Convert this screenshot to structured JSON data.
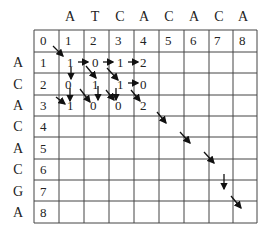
{
  "diagram": {
    "title": "",
    "top_sequence": [
      "A",
      "T",
      "C",
      "A",
      "C",
      "A",
      "C",
      "A"
    ],
    "left_sequence": [
      "A",
      "C",
      "A",
      "C",
      "A",
      "C",
      "G",
      "A"
    ],
    "header_row": [
      "0",
      "1",
      "2",
      "3",
      "4",
      "5",
      "6",
      "7",
      "8"
    ],
    "row_index": [
      "1",
      "2",
      "3",
      "4",
      "5",
      "6",
      "7",
      "8"
    ],
    "cells": [
      [
        "1",
        "0",
        "1",
        "2"
      ],
      [
        "0",
        "1",
        "1",
        "0"
      ],
      [
        "1",
        "0",
        "0",
        "2"
      ]
    ],
    "grid_color": "#333333",
    "arrow_color": "#111111"
  }
}
